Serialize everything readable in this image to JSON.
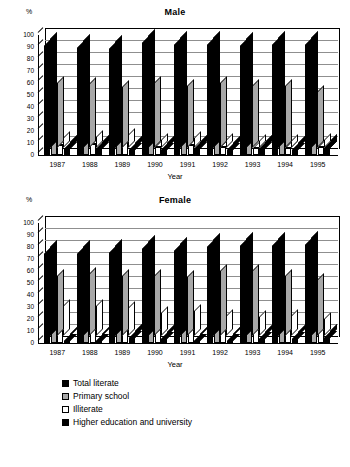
{
  "axis_unit_label": "%",
  "x_axis_title": "Year",
  "years": [
    "1987",
    "1988",
    "1989",
    "1990",
    "1991",
    "1992",
    "1993",
    "1994",
    "1995"
  ],
  "y_ticks": [
    "0",
    "10",
    "20",
    "30",
    "40",
    "50",
    "60",
    "70",
    "80",
    "90",
    "100"
  ],
  "legend": {
    "items": [
      {
        "label": "Total literate",
        "color": "#000000",
        "swatch": "sw0"
      },
      {
        "label": "Primary school",
        "color": "#a8a8a8",
        "swatch": "sw1"
      },
      {
        "label": "Illiterate",
        "color": "#ffffff",
        "swatch": "sw2"
      },
      {
        "label": "Higher education and university",
        "color": "#000000",
        "swatch": "sw3"
      }
    ]
  },
  "charts": [
    {
      "title": "Male"
    },
    {
      "title": "Female"
    }
  ],
  "chart_data": [
    {
      "type": "bar",
      "title": "Male",
      "xlabel": "Year",
      "ylabel": "%",
      "ylim": [
        0,
        100
      ],
      "ytick_step": 10,
      "grid": true,
      "legend_position": "bottom",
      "categories": [
        "1987",
        "1988",
        "1989",
        "1990",
        "1991",
        "1992",
        "1993",
        "1994",
        "1995"
      ],
      "series": [
        {
          "name": "Total literate",
          "color": "#000000",
          "values": [
            91,
            89,
            88,
            93,
            92,
            92,
            91,
            92,
            92
          ]
        },
        {
          "name": "Primary school",
          "color": "#a8a8a8",
          "values": [
            54,
            53,
            51,
            54,
            52,
            54,
            52,
            52,
            47
          ]
        },
        {
          "name": "Illiterate",
          "color": "#ffffff",
          "values": [
            8,
            9,
            11,
            7,
            8,
            7,
            6,
            6,
            7
          ]
        },
        {
          "name": "Higher education and university",
          "color": "#000000",
          "values": [
            5,
            5,
            4,
            4,
            5,
            4,
            5,
            4,
            6
          ]
        }
      ]
    },
    {
      "type": "bar",
      "title": "Female",
      "xlabel": "Year",
      "ylabel": "%",
      "ylim": [
        0,
        100
      ],
      "ytick_step": 10,
      "grid": true,
      "legend_position": "bottom",
      "categories": [
        "1987",
        "1988",
        "1989",
        "1990",
        "1991",
        "1992",
        "1993",
        "1994",
        "1995"
      ],
      "series": [
        {
          "name": "Total literate",
          "color": "#000000",
          "values": [
            74,
            74,
            75,
            78,
            77,
            80,
            81,
            81,
            82
          ]
        },
        {
          "name": "Primary school",
          "color": "#a8a8a8",
          "values": [
            50,
            52,
            50,
            50,
            49,
            54,
            54,
            50,
            47
          ]
        },
        {
          "name": "Illiterate",
          "color": "#ffffff",
          "values": [
            25,
            25,
            23,
            19,
            21,
            17,
            16,
            17,
            14
          ]
        },
        {
          "name": "Higher education and university",
          "color": "#000000",
          "values": [
            2,
            2,
            4,
            3,
            2,
            2,
            3,
            3,
            4
          ]
        }
      ]
    }
  ],
  "caption": ""
}
